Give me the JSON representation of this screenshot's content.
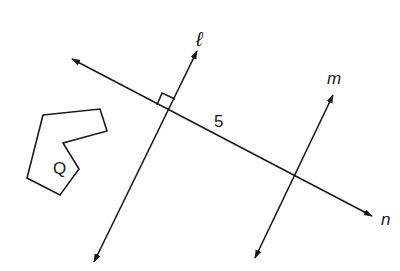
{
  "diagram": {
    "lines": [
      {
        "name": "l",
        "label": "ℓ",
        "from": [
          94,
          262
        ],
        "to": [
          197,
          51
        ],
        "label_pos": [
          198,
          44
        ]
      },
      {
        "name": "m",
        "label": "m",
        "from": [
          255,
          258
        ],
        "to": [
          333,
          95
        ],
        "label_pos": [
          331,
          83
        ]
      },
      {
        "name": "n",
        "label": "n",
        "from": [
          72,
          59
        ],
        "to": [
          372,
          216
        ],
        "label_pos": [
          382,
          224
        ]
      }
    ],
    "segment_label": {
      "text": "5",
      "pos": [
        216,
        125
      ]
    },
    "polygon": {
      "label": "Q",
      "label_pos": [
        52,
        173
      ],
      "points": "43,115 100,109 107,131 63,143 79,169 60,195 27,178"
    },
    "right_angle_marker": {
      "at_intersection": "l-n"
    },
    "colors": {
      "stroke": "#1a1a1a",
      "background": "#ffffff"
    }
  }
}
